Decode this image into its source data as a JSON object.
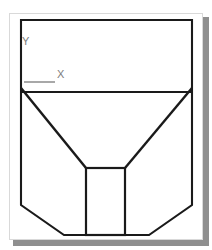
{
  "drawing": {
    "title": "Hopper Section View",
    "background_color": "#ffffff",
    "page_border_color": "#d9d9d9",
    "shadow_color": "#8f8f8f",
    "line_color": "#1a1a1a",
    "grid_marker_color": "#e2dede",
    "axis_label_color": "#7d7d7d",
    "leader_color": "#a8a8a8"
  },
  "axes": {
    "y_label": "Y",
    "x_label": "X",
    "origin_note": ""
  },
  "geometry": {
    "outer_body": {
      "name": "outer-profile",
      "points": "21,20 192,20 192,205 149,235 64,235 21,205"
    },
    "top_divider": {
      "name": "top-divider-line",
      "x1": 21,
      "y1": 92,
      "x2": 192,
      "y2": 92
    },
    "funnel_left": {
      "name": "funnel-left-wall",
      "x1": 21,
      "y1": 88,
      "x2": 86,
      "y2": 168
    },
    "funnel_right": {
      "name": "funnel-right-wall",
      "x1": 192,
      "y1": 88,
      "x2": 125,
      "y2": 168
    },
    "outlet_rect": {
      "name": "outlet-rectangle",
      "x": 86,
      "y": 168,
      "width": 39,
      "height": 67
    }
  },
  "grid": {
    "spacing_px": 40,
    "marker_size_px": 3,
    "x_positions": [
      40,
      80,
      120,
      160
    ],
    "y_positions": [
      43,
      83,
      123,
      163,
      203
    ]
  }
}
